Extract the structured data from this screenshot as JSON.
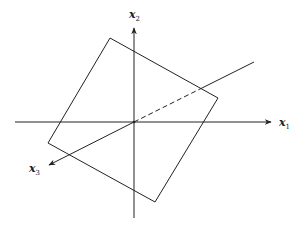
{
  "diagram": {
    "stroke_color": "#222222",
    "background": "#ffffff",
    "origin": [
      134,
      122
    ],
    "axes": [
      {
        "id": "x1",
        "label": "x",
        "subscript": "1",
        "from": [
          15,
          122
        ],
        "to": [
          273,
          122
        ],
        "arrow": true
      },
      {
        "id": "x2",
        "label": "x",
        "subscript": "2",
        "from": [
          134,
          218
        ],
        "to": [
          134,
          26
        ],
        "arrow": true
      },
      {
        "id": "x3",
        "label": "x",
        "subscript": "3",
        "front_from": [
          134,
          122
        ],
        "front_to": [
          47,
          166
        ],
        "back_from": [
          134,
          122
        ],
        "back_to": [
          254,
          62
        ],
        "hidden_dashed_until": [
          202,
          88
        ]
      }
    ],
    "plane": {
      "shape": "quadrilateral",
      "corners": [
        [
          110,
          38
        ],
        [
          218,
          98
        ],
        [
          155,
          202
        ],
        [
          48,
          143
        ]
      ]
    },
    "labels": {
      "x1": {
        "main": "x",
        "sub": "1"
      },
      "x2": {
        "main": "x",
        "sub": "2"
      },
      "x3": {
        "main": "x",
        "sub": "3"
      }
    }
  }
}
